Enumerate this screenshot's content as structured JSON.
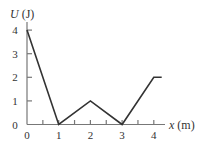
{
  "chart_data": {
    "type": "line",
    "title": "",
    "xlabel": "x (m)",
    "ylabel": "U (J)",
    "x": [
      0,
      1,
      2,
      3,
      4,
      4.25
    ],
    "values": [
      4,
      0,
      1,
      0,
      2,
      2
    ],
    "xlim": [
      0,
      4.4
    ],
    "ylim": [
      0,
      4.4
    ],
    "xticks": [
      "0",
      "1",
      "2",
      "3",
      "4"
    ],
    "yticks": [
      "0",
      "1",
      "2",
      "3",
      "4"
    ],
    "grid": false,
    "legend": null
  },
  "labels": {
    "ylabel_italic": "U",
    "ylabel_unit": " (J)",
    "xlabel_italic": "x",
    "xlabel_unit": " (m)"
  },
  "colors": {
    "axis": "#777777",
    "line": "#333333"
  }
}
